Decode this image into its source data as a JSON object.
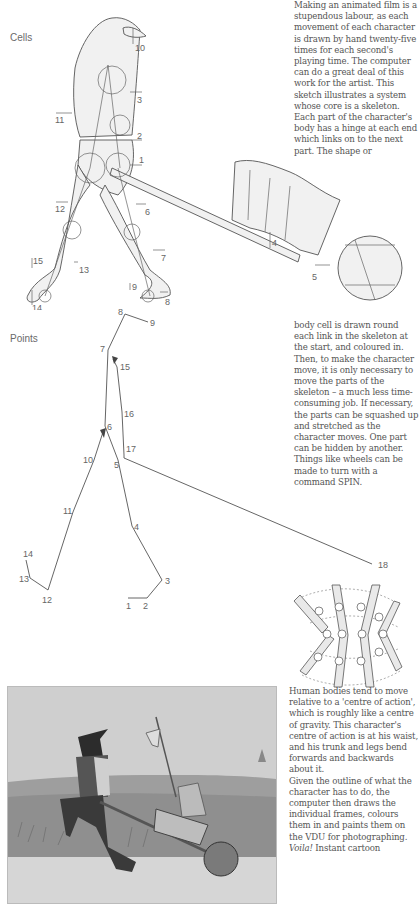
{
  "sections": {
    "cells_label": "Cells",
    "points_label": "Points"
  },
  "text_blocks": {
    "block1": "Making an animated film is a stupendous labour, as each movement of each character is drawn by hand twenty-five times for each second's playing time. The computer can do a great deal of this work for the artist. This sketch illustrates a system whose core is a skeleton. Each part of the character's body has a hinge at each end which links on to the next part. The shape or",
    "block2": "body cell is drawn round each link in the skeleton at the start, and coloured in. Then, to make the character move, it is only necessary to move the parts of the skeleton – a much less time-consuming job. If necessary, the parts can be squashed up and stretched as the character moves. One part can be hidden by another. Things like wheels can be made to turn with a command SPIN.",
    "block3a": "Human bodies tend to move relative to a 'centre of action', which is roughly like a centre of gravity. This character's centre of action is at his waist, and his trunk and legs bend forwards and backwards about it.",
    "block3b": "Given the outline of what the character has to do, the computer then draws the individual frames, colours them in and paints them on the VDU for photographing.",
    "block3c_italic": "Voila!",
    "block3c_rest": " Instant cartoon"
  },
  "cells_figure": {
    "part_numbers": [
      "1",
      "2",
      "3",
      "4",
      "5",
      "6",
      "7",
      "8",
      "9",
      "10",
      "11",
      "12",
      "13",
      "14",
      "15"
    ]
  },
  "points_figure": {
    "point_numbers": [
      "1",
      "2",
      "3",
      "4",
      "5",
      "6",
      "7",
      "8",
      "9",
      "10",
      "11",
      "12",
      "13",
      "14",
      "15",
      "16",
      "17",
      "18"
    ]
  },
  "photo": {
    "description": "cartoon still: hooded executioner pushing a wheelbarrow carrying a small armoured knight with a halberd"
  }
}
